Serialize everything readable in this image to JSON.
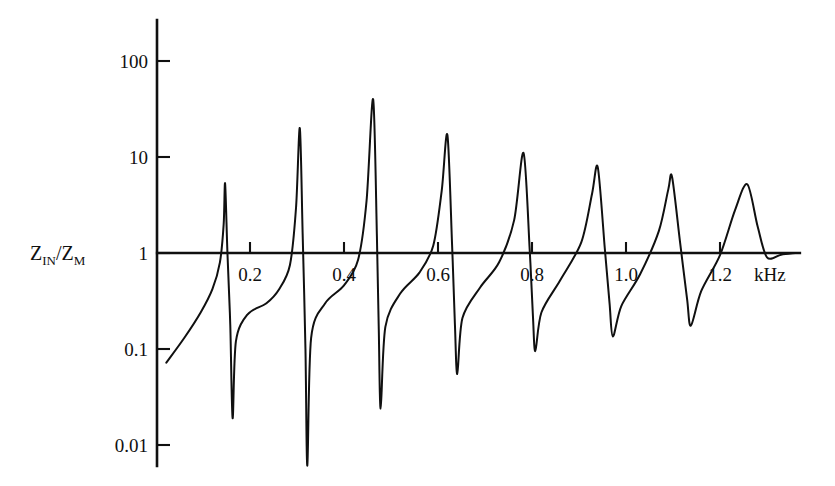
{
  "chart_data": {
    "type": "line",
    "title": "",
    "subtitle": "",
    "xlabel": "",
    "ylabel": "Z_IN/Z_M",
    "ylabel_parts": {
      "z1": "Z",
      "sub1": "IN",
      "slash": "/",
      "z2": "Z",
      "sub2": "M"
    },
    "x_unit": "kHz",
    "x_ticks": [
      0.2,
      0.4,
      0.6,
      0.8,
      1.0,
      1.2
    ],
    "x_tick_labels": [
      "0.2",
      "0.4",
      "0.6",
      "0.8",
      "1.0",
      "1.2"
    ],
    "xlim": [
      0.0,
      1.42
    ],
    "y_ticks": [
      100,
      10,
      1,
      0.1,
      0.01
    ],
    "y_tick_labels": [
      "100",
      "10",
      "1",
      "0.1",
      "0.01"
    ],
    "ylim": [
      0.0045,
      260
    ],
    "y_scale": "log",
    "grid": false,
    "legend": null,
    "axis_zero_level": 1,
    "series": [
      {
        "name": "Input impedance ratio",
        "color": "#101010",
        "resonances": [
          {
            "peak_f": 0.147,
            "peak_y": 5.3,
            "notch_f": 0.163,
            "notch_y": 0.019
          },
          {
            "peak_f": 0.306,
            "peak_y": 20.0,
            "notch_f": 0.322,
            "notch_y": 0.0061
          },
          {
            "peak_f": 0.462,
            "peak_y": 40.0,
            "notch_f": 0.478,
            "notch_y": 0.024
          },
          {
            "peak_f": 0.62,
            "peak_y": 17.0,
            "notch_f": 0.641,
            "notch_y": 0.055
          },
          {
            "peak_f": 0.782,
            "peak_y": 11.0,
            "notch_f": 0.807,
            "notch_y": 0.095
          },
          {
            "peak_f": 0.94,
            "peak_y": 7.8,
            "notch_f": 0.972,
            "notch_y": 0.135
          },
          {
            "peak_f": 1.098,
            "peak_y": 6.2,
            "notch_f": 1.138,
            "notch_y": 0.175
          },
          {
            "peak_f": 1.258,
            "peak_y": 5.2,
            "notch_f": 1.3,
            "notch_y": 0.9
          }
        ],
        "start_point": {
          "f": 0.022,
          "y": 0.072
        },
        "end_point": {
          "f": 1.36,
          "y": 1.0
        },
        "points": [
          {
            "f": 0.022,
            "y": 0.072
          },
          {
            "f": 0.06,
            "y": 0.13
          },
          {
            "f": 0.095,
            "y": 0.24
          },
          {
            "f": 0.12,
            "y": 0.42
          },
          {
            "f": 0.136,
            "y": 0.8
          },
          {
            "f": 0.144,
            "y": 2.0
          },
          {
            "f": 0.147,
            "y": 5.3
          },
          {
            "f": 0.152,
            "y": 1.0
          },
          {
            "f": 0.158,
            "y": 0.18
          },
          {
            "f": 0.163,
            "y": 0.019
          },
          {
            "f": 0.17,
            "y": 0.12
          },
          {
            "f": 0.195,
            "y": 0.23
          },
          {
            "f": 0.235,
            "y": 0.3
          },
          {
            "f": 0.262,
            "y": 0.42
          },
          {
            "f": 0.285,
            "y": 0.75
          },
          {
            "f": 0.298,
            "y": 3.0
          },
          {
            "f": 0.306,
            "y": 20.0
          },
          {
            "f": 0.312,
            "y": 1.6
          },
          {
            "f": 0.318,
            "y": 0.1
          },
          {
            "f": 0.322,
            "y": 0.0061
          },
          {
            "f": 0.33,
            "y": 0.13
          },
          {
            "f": 0.36,
            "y": 0.3
          },
          {
            "f": 0.4,
            "y": 0.46
          },
          {
            "f": 0.43,
            "y": 0.85
          },
          {
            "f": 0.448,
            "y": 3.5
          },
          {
            "f": 0.462,
            "y": 40.0
          },
          {
            "f": 0.47,
            "y": 1.5
          },
          {
            "f": 0.474,
            "y": 0.16
          },
          {
            "f": 0.478,
            "y": 0.024
          },
          {
            "f": 0.488,
            "y": 0.17
          },
          {
            "f": 0.52,
            "y": 0.38
          },
          {
            "f": 0.56,
            "y": 0.62
          },
          {
            "f": 0.59,
            "y": 1.2
          },
          {
            "f": 0.608,
            "y": 4.5
          },
          {
            "f": 0.62,
            "y": 17.0
          },
          {
            "f": 0.63,
            "y": 1.2
          },
          {
            "f": 0.636,
            "y": 0.18
          },
          {
            "f": 0.641,
            "y": 0.055
          },
          {
            "f": 0.652,
            "y": 0.21
          },
          {
            "f": 0.69,
            "y": 0.44
          },
          {
            "f": 0.73,
            "y": 0.8
          },
          {
            "f": 0.762,
            "y": 2.2
          },
          {
            "f": 0.782,
            "y": 11.0
          },
          {
            "f": 0.795,
            "y": 1.1
          },
          {
            "f": 0.802,
            "y": 0.22
          },
          {
            "f": 0.807,
            "y": 0.095
          },
          {
            "f": 0.82,
            "y": 0.24
          },
          {
            "f": 0.86,
            "y": 0.52
          },
          {
            "f": 0.905,
            "y": 1.3
          },
          {
            "f": 0.928,
            "y": 4.2
          },
          {
            "f": 0.94,
            "y": 7.8
          },
          {
            "f": 0.955,
            "y": 1.1
          },
          {
            "f": 0.965,
            "y": 0.3
          },
          {
            "f": 0.972,
            "y": 0.135
          },
          {
            "f": 0.99,
            "y": 0.28
          },
          {
            "f": 1.03,
            "y": 0.6
          },
          {
            "f": 1.07,
            "y": 1.7
          },
          {
            "f": 1.09,
            "y": 4.6
          },
          {
            "f": 1.098,
            "y": 6.2
          },
          {
            "f": 1.115,
            "y": 1.3
          },
          {
            "f": 1.13,
            "y": 0.33
          },
          {
            "f": 1.138,
            "y": 0.175
          },
          {
            "f": 1.16,
            "y": 0.4
          },
          {
            "f": 1.2,
            "y": 0.95
          },
          {
            "f": 1.232,
            "y": 2.8
          },
          {
            "f": 1.258,
            "y": 5.2
          },
          {
            "f": 1.28,
            "y": 1.9
          },
          {
            "f": 1.3,
            "y": 0.9
          },
          {
            "f": 1.33,
            "y": 0.96
          },
          {
            "f": 1.36,
            "y": 1.0
          }
        ]
      }
    ]
  },
  "geometry": {
    "x_axis_pixel_at_0_2": 250,
    "x_pixels_per_0_2_khz": 94,
    "y_pixel_at_1": 253,
    "y_pixels_per_decade": 96,
    "axis_left_x": 157,
    "axis_top_y": 20,
    "axis_bottom_y": 466,
    "axis_right_x": 800
  },
  "unit_label": "kHz"
}
